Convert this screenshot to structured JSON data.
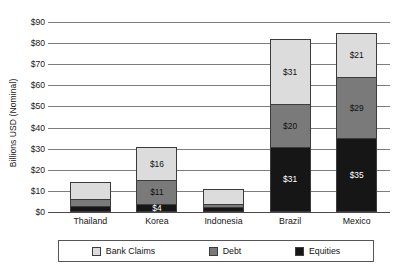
{
  "chart_data": {
    "type": "bar",
    "subtype": "stacked-bar",
    "title": "",
    "xlabel": "",
    "ylabel": "Billions USD (Nominal)",
    "ylim": [
      0,
      90
    ],
    "ytick_step": 10,
    "ytick_labels": [
      "$0",
      "$10",
      "$20",
      "$30",
      "$40",
      "$50",
      "$60",
      "$70",
      "$80",
      "$90"
    ],
    "ytick_values": [
      0,
      10,
      20,
      30,
      40,
      50,
      60,
      70,
      80,
      90
    ],
    "grid": "horizontal",
    "legend_position": "bottom",
    "categories": [
      "Thailand",
      "Korea",
      "Indonesia",
      "Brazil",
      "Mexico"
    ],
    "series": [
      {
        "name": "Equities",
        "color": "#161616",
        "values": [
          3,
          4,
          2.5,
          31,
          35
        ],
        "labels": [
          "",
          "$4",
          "",
          "$31",
          "$35"
        ]
      },
      {
        "name": "Debt",
        "color": "#7a7a7a",
        "values": [
          3,
          11,
          1.5,
          20,
          29
        ],
        "labels": [
          "",
          "$11",
          "",
          "$20",
          "$29"
        ]
      },
      {
        "name": "Bank Claims",
        "color": "#dcdcdc",
        "values": [
          8,
          16,
          7,
          31,
          21
        ],
        "labels": [
          "",
          "$16",
          "",
          "$31",
          "$21"
        ]
      }
    ],
    "totals": [
      14,
      31,
      11,
      82,
      85
    ]
  },
  "legend": {
    "items": [
      {
        "label": "Bank Claims",
        "color": "#dcdcdc"
      },
      {
        "label": "Debt",
        "color": "#7a7a7a"
      },
      {
        "label": "Equities",
        "color": "#161616"
      }
    ]
  }
}
